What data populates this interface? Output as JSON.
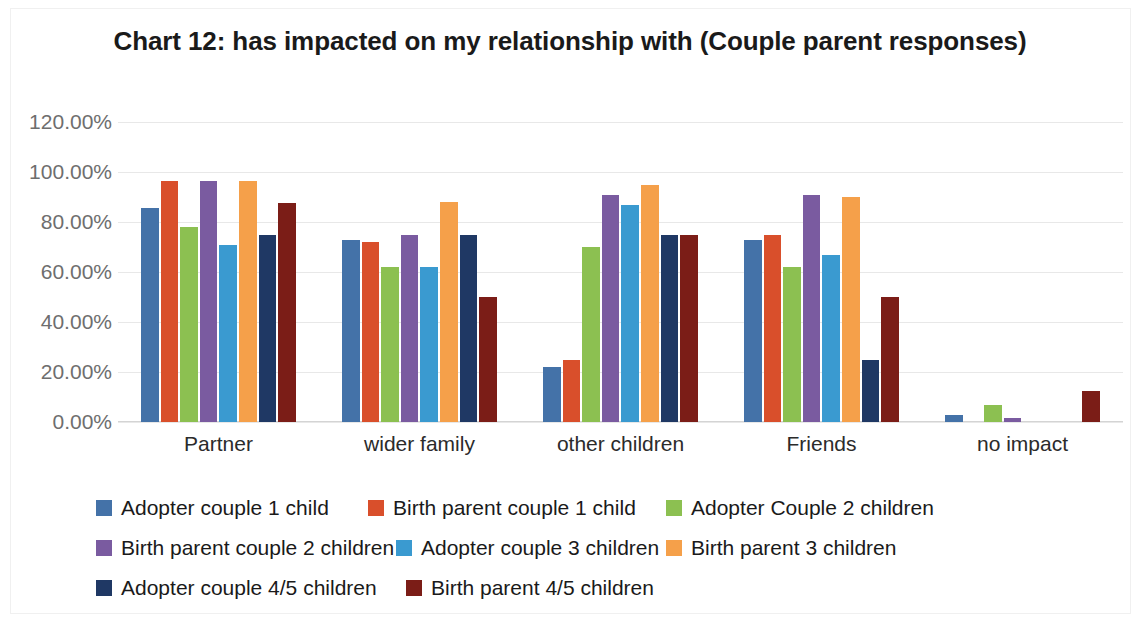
{
  "chart_data": {
    "type": "bar",
    "title": "Chart 12: has impacted on my relationship with (Couple parent responses)",
    "xlabel": "",
    "ylabel": "",
    "ylim": [
      0,
      120
    ],
    "grid": true,
    "legend_position": "bottom",
    "y_ticks": [
      "0.00%",
      "20.00%",
      "40.00%",
      "60.00%",
      "80.00%",
      "100.00%",
      "120.00%"
    ],
    "y_tick_values": [
      0,
      20,
      40,
      60,
      80,
      100,
      120
    ],
    "categories": [
      "Partner",
      "wider family",
      "other children",
      "Friends",
      "no impact"
    ],
    "series": [
      {
        "name": "Adopter couple 1 child",
        "color": "#4472a8",
        "values": [
          85.5,
          73.0,
          22.0,
          73.0,
          3.0
        ]
      },
      {
        "name": "Birth parent couple 1 child",
        "color": "#d94f2b",
        "values": [
          96.5,
          72.0,
          25.0,
          75.0,
          0.0
        ]
      },
      {
        "name": "Adopter Couple 2 children",
        "color": "#8cc051",
        "values": [
          78.0,
          62.0,
          70.0,
          62.0,
          7.0
        ]
      },
      {
        "name": "Birth parent couple 2 children",
        "color": "#7a5ba0",
        "values": [
          96.5,
          75.0,
          91.0,
          91.0,
          1.5
        ]
      },
      {
        "name": "Adopter couple 3 children",
        "color": "#3a9ad0",
        "values": [
          71.0,
          62.0,
          87.0,
          67.0,
          0.0
        ]
      },
      {
        "name": "Birth parent 3 children",
        "color": "#f5a04a",
        "values": [
          96.5,
          88.0,
          95.0,
          90.0,
          0.0
        ]
      },
      {
        "name": "Adopter couple 4/5 children",
        "color": "#1f3864",
        "values": [
          75.0,
          75.0,
          75.0,
          25.0,
          0.0
        ]
      },
      {
        "name": "Birth parent 4/5 children",
        "color": "#7b1d17",
        "values": [
          87.5,
          50.0,
          75.0,
          50.0,
          12.5
        ]
      }
    ]
  }
}
